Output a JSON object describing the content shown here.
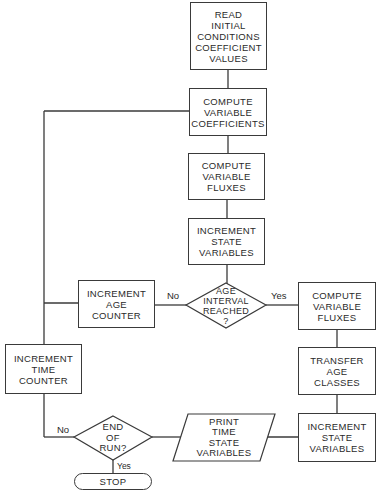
{
  "flowchart": {
    "nodes": {
      "read_initial": {
        "type": "process",
        "lines": [
          "READ",
          "INITIAL",
          "CONDITIONS",
          "COEFFICIENT",
          "VALUES"
        ]
      },
      "compute_coefficients": {
        "type": "process",
        "lines": [
          "COMPUTE",
          "VARIABLE",
          "COEFFICIENTS"
        ]
      },
      "compute_fluxes_main": {
        "type": "process",
        "lines": [
          "COMPUTE",
          "VARIABLE",
          "FLUXES"
        ]
      },
      "increment_state_main": {
        "type": "process",
        "lines": [
          "INCREMENT",
          "STATE",
          "VARIABLES"
        ]
      },
      "age_interval_decision": {
        "type": "decision",
        "lines": [
          "AGE",
          "INTERVAL",
          "REACHED",
          "?"
        ]
      },
      "increment_age_counter": {
        "type": "process",
        "lines": [
          "INCREMENT",
          "AGE",
          "COUNTER"
        ]
      },
      "compute_fluxes_age": {
        "type": "process",
        "lines": [
          "COMPUTE",
          "VARIABLE",
          "FLUXES"
        ]
      },
      "transfer_age_classes": {
        "type": "process",
        "lines": [
          "TRANSFER",
          "AGE",
          "CLASSES"
        ]
      },
      "increment_state_age": {
        "type": "process",
        "lines": [
          "INCREMENT",
          "STATE",
          "VARIABLES"
        ]
      },
      "increment_time_counter": {
        "type": "process",
        "lines": [
          "INCREMENT",
          "TIME",
          "COUNTER"
        ]
      },
      "end_of_run_decision": {
        "type": "decision",
        "lines": [
          "END",
          "OF",
          "RUN?"
        ]
      },
      "print_output": {
        "type": "io",
        "lines": [
          "PRINT",
          "TIME",
          "STATE",
          "VARIABLES"
        ]
      },
      "stop": {
        "type": "terminal",
        "label": "STOP"
      }
    },
    "edge_labels": {
      "age_no": "No",
      "age_yes": "Yes",
      "end_no": "No",
      "end_yes": "Yes"
    },
    "colors": {
      "line": "#3a3a3a",
      "text": "#2a2a2a",
      "background": "#ffffff"
    }
  }
}
